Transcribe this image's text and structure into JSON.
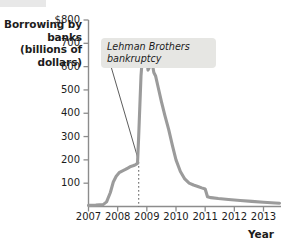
{
  "chart_data": {
    "type": "line",
    "title": "",
    "xlabel": "Year",
    "ylabel": "Borrowing by banks (billions of dollars)",
    "xlim": [
      2007,
      2013.6
    ],
    "ylim": [
      0,
      800
    ],
    "grid": false,
    "legend": "none",
    "line_color": "#9b9b9b",
    "xtick_labels": [
      "2007",
      "2008",
      "2009",
      "2010",
      "2011",
      "2012",
      "2013"
    ],
    "xticks": [
      2007,
      2008,
      2009,
      2010,
      2011,
      2012,
      2013
    ],
    "ytick_labels": [
      "$800",
      "700",
      "600",
      "500",
      "400",
      "300",
      "200",
      "100"
    ],
    "yticks": [
      800,
      700,
      600,
      500,
      400,
      300,
      200,
      100
    ],
    "series": [
      {
        "name": "Borrowing by banks",
        "x": [
          2007.0,
          2007.25,
          2007.5,
          2007.62,
          2007.75,
          2007.85,
          2007.95,
          2008.05,
          2008.15,
          2008.25,
          2008.35,
          2008.45,
          2008.55,
          2008.62,
          2008.68,
          2008.72,
          2008.76,
          2008.8,
          2008.86,
          2008.92,
          2008.98,
          2009.04,
          2009.1,
          2009.14,
          2009.18,
          2009.24,
          2009.3,
          2009.4,
          2009.5,
          2009.62,
          2009.75,
          2009.88,
          2010.0,
          2010.15,
          2010.3,
          2010.45,
          2010.6,
          2010.75,
          2010.88,
          2011.0,
          2011.08,
          2011.2,
          2011.45,
          2011.8,
          2012.2,
          2012.6,
          2013.0,
          2013.4,
          2013.55
        ],
        "y": [
          5,
          6,
          8,
          20,
          60,
          105,
          130,
          145,
          152,
          158,
          165,
          172,
          176,
          180,
          185,
          300,
          430,
          560,
          660,
          700,
          660,
          585,
          600,
          628,
          618,
          575,
          560,
          505,
          450,
          390,
          330,
          260,
          200,
          150,
          118,
          100,
          92,
          86,
          80,
          75,
          42,
          38,
          34,
          30,
          26,
          22,
          18,
          15,
          14
        ]
      }
    ],
    "annotations": [
      {
        "name": "lehman-brothers-bankruptcy",
        "text": "Lehman Brothers\nbankruptcy",
        "at_x": 2008.72,
        "style": "italic",
        "box_background": "#e6e6e3",
        "leader_line": true,
        "dotted_marker_line": true
      }
    ]
  }
}
